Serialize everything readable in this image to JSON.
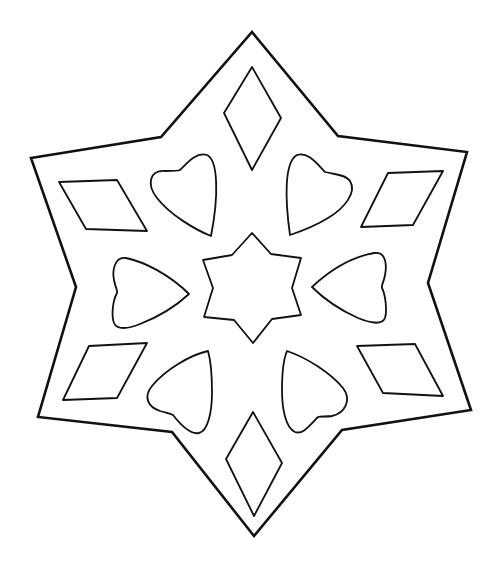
{
  "image": {
    "description": "Coloring page: six-pointed star outline with cut-out shapes",
    "width": 500,
    "height": 567,
    "colors": {
      "background": "#ffffff",
      "stroke": "#111111"
    }
  },
  "shapes": {
    "outer_star": {
      "label": "six-pointed star outline"
    },
    "center_star": {
      "label": "small six-pointed star"
    },
    "diamonds": [
      {
        "label": "top diamond"
      },
      {
        "label": "bottom diamond"
      },
      {
        "label": "upper-left rhombus"
      },
      {
        "label": "upper-right rhombus"
      },
      {
        "label": "lower-left rhombus"
      },
      {
        "label": "lower-right rhombus"
      }
    ],
    "hearts": [
      {
        "label": "upper-left heart"
      },
      {
        "label": "upper-right heart"
      },
      {
        "label": "left heart"
      },
      {
        "label": "right heart"
      },
      {
        "label": "lower-left heart"
      },
      {
        "label": "lower-right heart"
      }
    ]
  }
}
